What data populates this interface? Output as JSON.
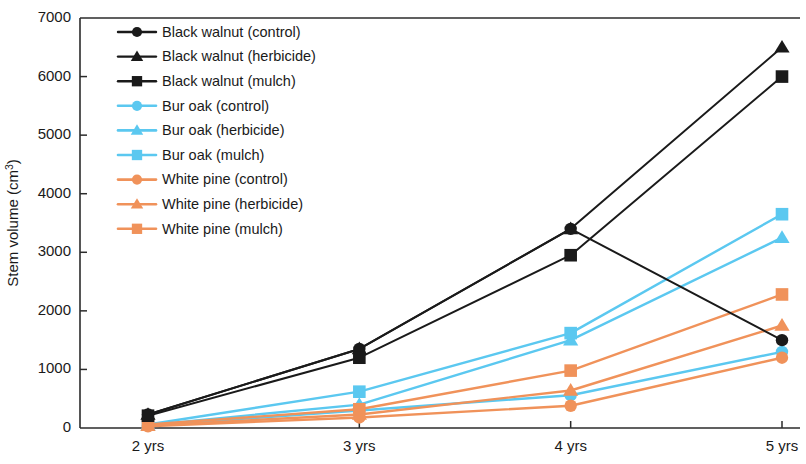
{
  "chart_data": {
    "type": "line",
    "title": "",
    "xlabel": "",
    "ylabel": "Stem volume (cm3)",
    "ylabel_base": "Stem volume (cm",
    "ylabel_sup": "3",
    "ylabel_close": ")",
    "categories": [
      "2 yrs",
      "3 yrs",
      "4 yrs",
      "5 yrs"
    ],
    "ylim": [
      0,
      7000
    ],
    "ytick_values": [
      0,
      1000,
      2000,
      3000,
      4000,
      5000,
      6000,
      7000
    ],
    "ytick_labels": [
      "0",
      "1000",
      "2000",
      "3000",
      "4000",
      "5000",
      "6000",
      "7000"
    ],
    "grid": false,
    "legend_position": "top-left-inside",
    "series": [
      {
        "name": "Black walnut (control)",
        "color": "#1a1a1a",
        "marker": "circle",
        "values": [
          230,
          1350,
          3400,
          1500
        ]
      },
      {
        "name": "Black walnut (herbicide)",
        "color": "#1a1a1a",
        "marker": "triangle",
        "values": [
          230,
          1350,
          3400,
          6500
        ]
      },
      {
        "name": "Black walnut (mulch)",
        "color": "#1a1a1a",
        "marker": "square",
        "values": [
          210,
          1200,
          2950,
          6000
        ]
      },
      {
        "name": "Bur oak (control)",
        "color": "#5bc8f0",
        "marker": "circle",
        "values": [
          40,
          300,
          560,
          1300
        ]
      },
      {
        "name": "Bur oak (herbicide)",
        "color": "#5bc8f0",
        "marker": "triangle",
        "values": [
          50,
          400,
          1500,
          3250
        ]
      },
      {
        "name": "Bur oak (mulch)",
        "color": "#5bc8f0",
        "marker": "square",
        "values": [
          60,
          620,
          1620,
          3650
        ]
      },
      {
        "name": "White pine (control)",
        "color": "#f0925a",
        "marker": "circle",
        "values": [
          30,
          180,
          380,
          1200
        ]
      },
      {
        "name": "White pine (herbicide)",
        "color": "#f0925a",
        "marker": "triangle",
        "values": [
          40,
          230,
          640,
          1750
        ]
      },
      {
        "name": "White pine (mulch)",
        "color": "#f0925a",
        "marker": "square",
        "values": [
          60,
          320,
          980,
          2280
        ]
      }
    ]
  }
}
